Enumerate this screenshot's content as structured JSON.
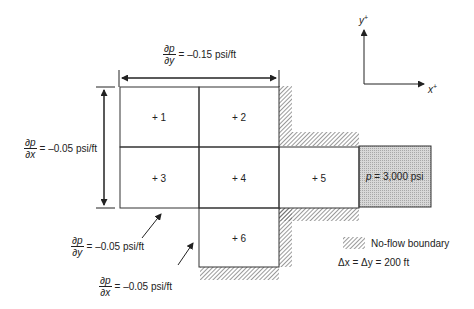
{
  "diagram": {
    "cells": [
      {
        "id": 1,
        "label": "+ 1"
      },
      {
        "id": 2,
        "label": "+ 2"
      },
      {
        "id": 3,
        "label": "+ 3"
      },
      {
        "id": 4,
        "label": "+ 4"
      },
      {
        "id": 5,
        "label": "+ 5"
      },
      {
        "id": 6,
        "label": "+ 6"
      }
    ],
    "constant_pressure": {
      "var": "p",
      "text": " = 3,000 psi"
    },
    "gradients": {
      "top": {
        "num": "∂p",
        "den": "∂y",
        "value": "= –0.15 psi/ft"
      },
      "left": {
        "num": "∂p",
        "den": "∂x",
        "value": "= –0.05 psi/ft"
      },
      "bottom_y": {
        "num": "∂p",
        "den": "∂y",
        "value": "= –0.05 psi/ft"
      },
      "bottom_x": {
        "num": "∂p",
        "den": "∂x",
        "value": "= –0.05 psi/ft"
      }
    },
    "axes": {
      "y_label": "y",
      "x_label": "x",
      "sup": "+"
    },
    "legend": {
      "no_flow": "No-flow boundary",
      "spacing": "Δx = Δy = 200 ft"
    },
    "colors": {
      "line": "#333333",
      "hatch": "#555555",
      "fill": "#cfcfcf"
    }
  }
}
